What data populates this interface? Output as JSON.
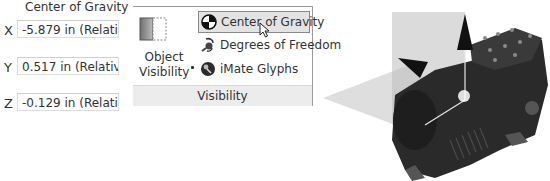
{
  "center_of_gravity_panel": {
    "title": "Center of Gravity",
    "rows": [
      {
        "axis": "X",
        "value": "-5.879 in (Relative"
      },
      {
        "axis": "Y",
        "value": "0.517 in (Relative E"
      },
      {
        "axis": "Z",
        "value": "-0.129 in (Relative"
      }
    ]
  },
  "ribbon": {
    "object_visibility": {
      "line1": "Object",
      "line2": "Visibility",
      "icon": "object-visibility-icon"
    },
    "commands": [
      {
        "label": "Center of Gravity",
        "icon": "center-of-gravity-icon",
        "active": true
      },
      {
        "label": "Degrees of Freedom",
        "icon": "degrees-of-freedom-icon",
        "active": false
      },
      {
        "label": "iMate Glyphs",
        "icon": "imate-glyphs-icon",
        "active": false
      }
    ],
    "group_label": "Visibility"
  },
  "viewport": {
    "description": "3D compressor model with center of gravity triad"
  }
}
